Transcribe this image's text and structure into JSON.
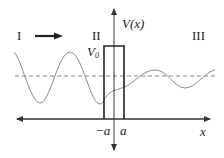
{
  "diagram": {
    "regions": [
      {
        "id": "region-1",
        "label": "I"
      },
      {
        "id": "region-2",
        "label": "II"
      },
      {
        "id": "region-3",
        "label": "III"
      }
    ],
    "axes": {
      "vertical_label": "V(x)",
      "horizontal_label": "x"
    },
    "barrier": {
      "height_label_main": "V",
      "height_label_sub": "0",
      "left_edge_label": "−a",
      "right_edge_label": "a"
    },
    "incident_direction_icon": "arrow-right-icon",
    "colors": {
      "axis": "#333333",
      "barrier": "#222222",
      "wave": "#8a8a8a",
      "energy_line": "#777777",
      "text": "#222222"
    }
  }
}
